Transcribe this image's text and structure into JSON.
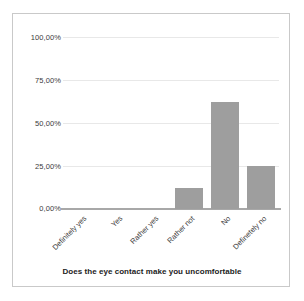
{
  "chart_data": {
    "type": "bar",
    "title": "",
    "xlabel": "Does the eye contact make you uncomfortable",
    "ylabel": "",
    "categories": [
      "Definitely yes",
      "Yes",
      "Rather yes",
      "Rather not",
      "No",
      "Definetely no"
    ],
    "values": [
      0,
      0,
      0,
      12.5,
      62.5,
      25
    ],
    "ylim": [
      0,
      100
    ],
    "yticks": [
      0,
      25,
      50,
      75,
      100
    ],
    "ytick_labels": [
      "0,00%",
      "25,00%",
      "50,00%",
      "75,00%",
      "100,00%"
    ],
    "grid": true,
    "legend": "none",
    "bar_color": "#9e9e9e",
    "gridline_color": "#e8e8e8",
    "axis_color": "#a8a8a8",
    "frame_color": "#c9c9c9",
    "background": "#ffffff"
  }
}
